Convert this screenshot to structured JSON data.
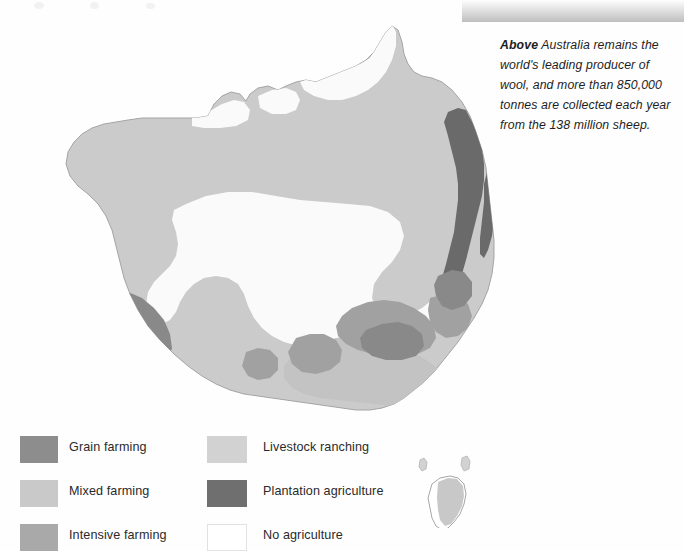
{
  "caption": {
    "lead": "Above",
    "text": "Australia remains the world's leading producer of wool, and more than 850,000 tonnes are collected each year from the 138 million sheep."
  },
  "photo": {
    "name": "sheep-shearing-photo-strip"
  },
  "map": {
    "title": "Agriculture in Australia",
    "subject": "Australia",
    "regions": [
      {
        "id": "livestock-ranching",
        "label": "Livestock ranching",
        "color": "#cfcfcf"
      },
      {
        "id": "mixed-farming",
        "label": "Mixed farming",
        "color": "#c6c6c6"
      },
      {
        "id": "intensive-farming",
        "label": "Intensive farming",
        "color": "#a8a8a8"
      },
      {
        "id": "grain-farming",
        "label": "Grain farming",
        "color": "#8d8d8d"
      },
      {
        "id": "plantation-agriculture",
        "label": "Plantation agriculture",
        "color": "#6e6e6e"
      },
      {
        "id": "no-agriculture",
        "label": "No agriculture",
        "color": "#ffffff"
      }
    ],
    "islands": [
      {
        "id": "tasmania",
        "label": "Tasmania"
      },
      {
        "id": "king-island",
        "label": "King Island"
      },
      {
        "id": "flinders-island",
        "label": "Flinders Island"
      }
    ],
    "outline_color": "#9a9a9a"
  },
  "legend": {
    "columns": [
      {
        "id": "legend-column-left",
        "items": [
          {
            "id": "grain-farming",
            "label": "Grain farming",
            "color": "#8d8d8d"
          },
          {
            "id": "mixed-farming",
            "label": "Mixed farming",
            "color": "#c9c9c9"
          },
          {
            "id": "intensive-farming",
            "label": "Intensive farming",
            "color": "#a9a9a9"
          }
        ]
      },
      {
        "id": "legend-column-right",
        "items": [
          {
            "id": "livestock-ranching",
            "label": "Livestock ranching",
            "color": "#d2d2d2"
          },
          {
            "id": "plantation-agriculture",
            "label": "Plantation agriculture",
            "color": "#6f6f6f"
          },
          {
            "id": "no-agriculture",
            "label": "No agriculture",
            "color": "#ffffff"
          }
        ]
      }
    ]
  }
}
